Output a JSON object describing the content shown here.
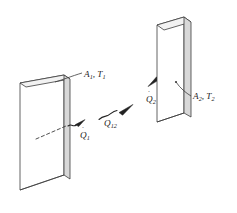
{
  "figure": {
    "background_color": "#ffffff",
    "line_color": "#3c3c3c",
    "face_fill": "#ffffff",
    "edge_fill": "#d8d8d8",
    "text_color": "#1b1b1b"
  },
  "labels": {
    "surface1": {
      "area_symbol": "A",
      "area_sub": "1",
      "separator": ", ",
      "temp_symbol": "T",
      "temp_sub": "1",
      "full": "A1, T1"
    },
    "surface2": {
      "area_symbol": "A",
      "area_sub": "2",
      "separator": ", ",
      "temp_symbol": "T",
      "temp_sub": "2",
      "full": "A2, T2"
    },
    "heat1": {
      "symbol": "Q",
      "dot": "˙",
      "sub": "1",
      "full": "Q̇ 1"
    },
    "heat12": {
      "symbol": "Q",
      "dot": "˙",
      "sub": "12",
      "full": "Q̇ 12"
    },
    "heat2": {
      "symbol": "Q",
      "dot": "˙",
      "sub": "2",
      "full": "Q̇ 2"
    }
  },
  "elements": {
    "plate1_name": "Left plate, surface 1",
    "plate2_name": "Right plate, surface 2",
    "arrow_q1_name": "Wavy radiation arrow leaving surface 1",
    "arrow_q12_name": "Wavy radiation arrow from surface 1 to surface 2",
    "arrow_q2_name": "Wavy radiation arrow arriving at surface 2",
    "dashed_ray_name": "Dashed ray behind surface 1",
    "leader1_name": "Leader line to A1 T1 label",
    "leader2_name": "Leader line to A2 T2 label"
  }
}
